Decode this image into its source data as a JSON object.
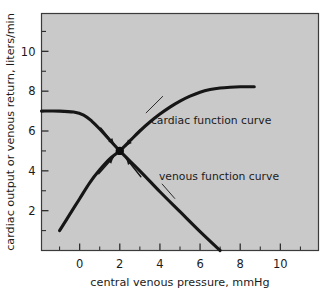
{
  "figure": {
    "background_color": "#ffffff",
    "plot_background_color": "#c9c9c9",
    "curve_color": "#161616",
    "frame_color": "#3a3a3a"
  },
  "chart_data": {
    "type": "line",
    "title": "",
    "subtitle": "",
    "xlabel": "central venous pressure, mmHg",
    "ylabel": "cardiac output or venous return, liters/min",
    "xlim": [
      -1.9,
      11.9
    ],
    "ylim": [
      0,
      11.9
    ],
    "grid": false,
    "legend_position": "inline-annotations",
    "xticks_major": [
      0,
      2,
      4,
      6,
      8,
      10
    ],
    "xticklabels": [
      "0",
      "2",
      "4",
      "6",
      "8",
      "10"
    ],
    "xticks_minor": [
      -1,
      1,
      3,
      5,
      7,
      9,
      11
    ],
    "yticks_major": [
      2,
      4,
      6,
      8,
      10
    ],
    "yticklabels": [
      "2",
      "4",
      "6",
      "8",
      "10"
    ],
    "yticks_minor": [
      1,
      3,
      5,
      7,
      9,
      11
    ],
    "equilibrium_point": {
      "x": 2.0,
      "y": 5.0,
      "label": ""
    },
    "series": [
      {
        "name": "cardiac function curve",
        "annotation": "cardiac function curve",
        "description": "rises steeply from low central venous pressure then plateaus near 8.2 L/min",
        "points": [
          {
            "x": -1.0,
            "y": 1.0
          },
          {
            "x": -0.5,
            "y": 1.8
          },
          {
            "x": 0.0,
            "y": 2.6
          },
          {
            "x": 0.5,
            "y": 3.4
          },
          {
            "x": 1.0,
            "y": 4.05
          },
          {
            "x": 1.5,
            "y": 4.6
          },
          {
            "x": 2.0,
            "y": 5.0
          },
          {
            "x": 2.5,
            "y": 5.5
          },
          {
            "x": 3.0,
            "y": 6.0
          },
          {
            "x": 3.5,
            "y": 6.45
          },
          {
            "x": 4.0,
            "y": 6.85
          },
          {
            "x": 4.5,
            "y": 7.2
          },
          {
            "x": 5.0,
            "y": 7.5
          },
          {
            "x": 5.5,
            "y": 7.75
          },
          {
            "x": 6.0,
            "y": 7.95
          },
          {
            "x": 6.5,
            "y": 8.08
          },
          {
            "x": 7.0,
            "y": 8.16
          },
          {
            "x": 7.5,
            "y": 8.2
          },
          {
            "x": 8.0,
            "y": 8.22
          },
          {
            "x": 8.7,
            "y": 8.22
          }
        ]
      },
      {
        "name": "venous function curve",
        "annotation": "venous function curve",
        "description": "flat plateau near 7.0 L/min at negative pressures, then falls linearly to zero near 7 mmHg",
        "points": [
          {
            "x": -1.9,
            "y": 7.0
          },
          {
            "x": -1.0,
            "y": 7.0
          },
          {
            "x": -0.3,
            "y": 6.95
          },
          {
            "x": 0.2,
            "y": 6.8
          },
          {
            "x": 0.6,
            "y": 6.5
          },
          {
            "x": 1.0,
            "y": 6.1
          },
          {
            "x": 2.0,
            "y": 5.0
          },
          {
            "x": 3.0,
            "y": 4.0
          },
          {
            "x": 4.0,
            "y": 2.95
          },
          {
            "x": 5.0,
            "y": 1.95
          },
          {
            "x": 6.0,
            "y": 0.95
          },
          {
            "x": 7.0,
            "y": 0.0
          }
        ]
      }
    ],
    "annotations": [
      {
        "name": "cardiac-function-curve-label",
        "text": "cardiac function curve",
        "x": 3.55,
        "y": 6.35,
        "leader_from": {
          "x": 3.3,
          "y": 6.9
        },
        "leader_to": {
          "x": 4.15,
          "y": 7.75
        }
      },
      {
        "name": "venous-function-curve-label",
        "text": "venous function curve",
        "x": 3.95,
        "y": 3.55,
        "leader_from": {
          "x": 4.1,
          "y": 3.35
        },
        "leader_to": {
          "x": 4.75,
          "y": 2.6
        }
      }
    ],
    "arrows": [
      {
        "name": "arrow-upper-left",
        "from": {
          "x": 1.05,
          "y": 6.15
        },
        "to": {
          "x": 1.72,
          "y": 5.32
        }
      },
      {
        "name": "arrow-upper-right",
        "from": {
          "x": 3.0,
          "y": 6.05
        },
        "to": {
          "x": 2.3,
          "y": 5.25
        }
      },
      {
        "name": "arrow-lower-left",
        "from": {
          "x": 0.95,
          "y": 3.85
        },
        "to": {
          "x": 1.68,
          "y": 4.68
        }
      },
      {
        "name": "arrow-lower-right",
        "from": {
          "x": 3.05,
          "y": 3.7
        },
        "to": {
          "x": 2.32,
          "y": 4.62
        }
      }
    ]
  }
}
